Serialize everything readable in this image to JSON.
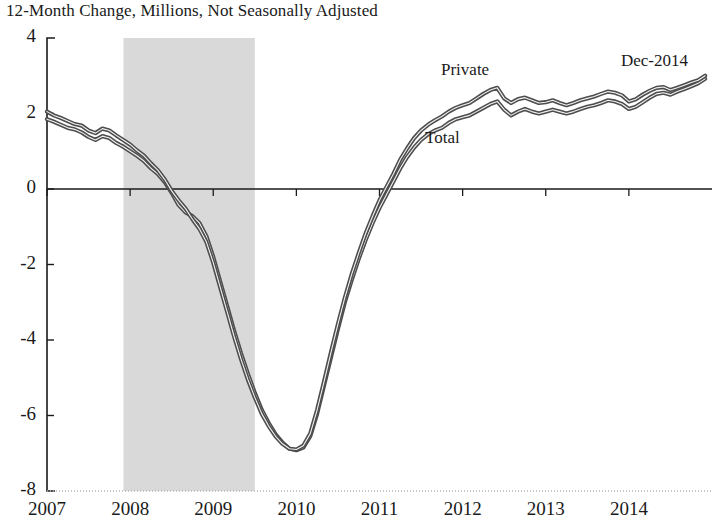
{
  "chart_data": {
    "type": "line",
    "title": "12-Month Change, Millions, Not Seasonally Adjusted",
    "xlabel": "",
    "ylabel": "",
    "ylim": [
      -8,
      4
    ],
    "xlim": [
      2007.0,
      2015.0
    ],
    "yticks": [
      4,
      2,
      0,
      -2,
      -4,
      -6,
      -8
    ],
    "ytick_labels": [
      "4",
      "2",
      "0",
      "-2",
      "-4",
      "-6",
      "-8"
    ],
    "xticks": [
      2007,
      2008,
      2009,
      2010,
      2011,
      2012,
      2013,
      2014
    ],
    "xtick_labels": [
      "2007",
      "2008",
      "2009",
      "2010",
      "2011",
      "2012",
      "2013",
      "2014"
    ],
    "grid": false,
    "legend_position": "inline-annotation",
    "annotations": [
      {
        "text": "Private",
        "x": 2012.0,
        "y": 3.05,
        "name": "private-series-label"
      },
      {
        "text": "Total",
        "x": 2011.6,
        "y": 1.25,
        "name": "total-series-label"
      },
      {
        "text": "Dec-2014",
        "x": 2014.55,
        "y": 3.25,
        "name": "last-observation-label"
      }
    ],
    "shaded_regions": [
      {
        "name": "recession-band",
        "x_start": 2007.92,
        "x_end": 2009.5,
        "color": "#d9d9d9",
        "label": "Recession"
      }
    ],
    "zero_line": {
      "value": 0,
      "color": "#1a1a1a"
    },
    "series": [
      {
        "name": "Total",
        "color": "#4d4d4d",
        "x": [
          2007.0,
          2007.083,
          2007.167,
          2007.25,
          2007.333,
          2007.417,
          2007.5,
          2007.583,
          2007.667,
          2007.75,
          2007.833,
          2007.917,
          2008.0,
          2008.083,
          2008.167,
          2008.25,
          2008.333,
          2008.417,
          2008.5,
          2008.583,
          2008.667,
          2008.75,
          2008.833,
          2008.917,
          2009.0,
          2009.083,
          2009.167,
          2009.25,
          2009.333,
          2009.417,
          2009.5,
          2009.583,
          2009.667,
          2009.75,
          2009.833,
          2009.917,
          2010.0,
          2010.083,
          2010.167,
          2010.25,
          2010.333,
          2010.417,
          2010.5,
          2010.583,
          2010.667,
          2010.75,
          2010.833,
          2010.917,
          2011.0,
          2011.083,
          2011.167,
          2011.25,
          2011.333,
          2011.417,
          2011.5,
          2011.583,
          2011.667,
          2011.75,
          2011.833,
          2011.917,
          2012.0,
          2012.083,
          2012.167,
          2012.25,
          2012.333,
          2012.417,
          2012.5,
          2012.583,
          2012.667,
          2012.75,
          2012.833,
          2012.917,
          2013.0,
          2013.083,
          2013.167,
          2013.25,
          2013.333,
          2013.417,
          2013.5,
          2013.583,
          2013.667,
          2013.75,
          2013.833,
          2013.917,
          2014.0,
          2014.083,
          2014.167,
          2014.25,
          2014.333,
          2014.417,
          2014.5,
          2014.583,
          2014.667,
          2014.75,
          2014.833,
          2014.917
        ],
        "values": [
          1.85,
          1.78,
          1.7,
          1.62,
          1.58,
          1.5,
          1.38,
          1.3,
          1.4,
          1.35,
          1.22,
          1.12,
          1.0,
          0.88,
          0.74,
          0.55,
          0.4,
          0.18,
          -0.1,
          -0.42,
          -0.62,
          -0.72,
          -0.9,
          -1.25,
          -1.8,
          -2.45,
          -3.1,
          -3.75,
          -4.35,
          -4.9,
          -5.4,
          -5.85,
          -6.2,
          -6.5,
          -6.72,
          -6.88,
          -6.92,
          -6.85,
          -6.55,
          -5.95,
          -5.2,
          -4.45,
          -3.7,
          -3.0,
          -2.4,
          -1.85,
          -1.35,
          -0.9,
          -0.5,
          -0.15,
          0.2,
          0.55,
          0.85,
          1.1,
          1.3,
          1.45,
          1.55,
          1.62,
          1.75,
          1.85,
          1.9,
          1.95,
          2.05,
          2.15,
          2.25,
          2.32,
          2.1,
          1.95,
          2.05,
          2.12,
          2.05,
          2.0,
          2.05,
          2.1,
          2.05,
          2.0,
          2.05,
          2.12,
          2.18,
          2.22,
          2.28,
          2.35,
          2.32,
          2.25,
          2.12,
          2.18,
          2.3,
          2.42,
          2.52,
          2.55,
          2.5,
          2.58,
          2.65,
          2.72,
          2.8,
          2.92
        ]
      },
      {
        "name": "Private",
        "color": "#4d4d4d",
        "x": [
          2007.0,
          2007.083,
          2007.167,
          2007.25,
          2007.333,
          2007.417,
          2007.5,
          2007.583,
          2007.667,
          2007.75,
          2007.833,
          2007.917,
          2008.0,
          2008.083,
          2008.167,
          2008.25,
          2008.333,
          2008.417,
          2008.5,
          2008.583,
          2008.667,
          2008.75,
          2008.833,
          2008.917,
          2009.0,
          2009.083,
          2009.167,
          2009.25,
          2009.333,
          2009.417,
          2009.5,
          2009.583,
          2009.667,
          2009.75,
          2009.833,
          2009.917,
          2010.0,
          2010.083,
          2010.167,
          2010.25,
          2010.333,
          2010.417,
          2010.5,
          2010.583,
          2010.667,
          2010.75,
          2010.833,
          2010.917,
          2011.0,
          2011.083,
          2011.167,
          2011.25,
          2011.333,
          2011.417,
          2011.5,
          2011.583,
          2011.667,
          2011.75,
          2011.833,
          2011.917,
          2012.0,
          2012.083,
          2012.167,
          2012.25,
          2012.333,
          2012.417,
          2012.5,
          2012.583,
          2012.667,
          2012.75,
          2012.833,
          2012.917,
          2013.0,
          2013.083,
          2013.167,
          2013.25,
          2013.333,
          2013.417,
          2013.5,
          2013.583,
          2013.667,
          2013.75,
          2013.833,
          2013.917,
          2014.0,
          2014.083,
          2014.167,
          2014.25,
          2014.333,
          2014.417,
          2014.5,
          2014.583,
          2014.667,
          2014.75,
          2014.833,
          2014.917
        ],
        "values": [
          2.05,
          1.95,
          1.88,
          1.8,
          1.72,
          1.68,
          1.55,
          1.48,
          1.6,
          1.55,
          1.42,
          1.3,
          1.18,
          1.02,
          0.88,
          0.68,
          0.5,
          0.25,
          -0.05,
          -0.3,
          -0.52,
          -0.8,
          -1.05,
          -1.4,
          -1.95,
          -2.6,
          -3.25,
          -3.9,
          -4.5,
          -5.05,
          -5.52,
          -5.95,
          -6.28,
          -6.55,
          -6.75,
          -6.88,
          -6.9,
          -6.8,
          -6.48,
          -5.85,
          -5.1,
          -4.32,
          -3.58,
          -2.88,
          -2.25,
          -1.7,
          -1.18,
          -0.72,
          -0.3,
          0.05,
          0.4,
          0.78,
          1.08,
          1.35,
          1.55,
          1.7,
          1.82,
          1.92,
          2.05,
          2.15,
          2.22,
          2.28,
          2.4,
          2.52,
          2.62,
          2.68,
          2.4,
          2.28,
          2.38,
          2.42,
          2.35,
          2.28,
          2.3,
          2.35,
          2.28,
          2.22,
          2.28,
          2.35,
          2.4,
          2.45,
          2.52,
          2.58,
          2.55,
          2.48,
          2.32,
          2.38,
          2.5,
          2.6,
          2.68,
          2.7,
          2.62,
          2.68,
          2.75,
          2.82,
          2.88,
          3.0
        ]
      }
    ]
  },
  "chart": {
    "title": "12-Month Change, Millions, Not Seasonally Adjusted",
    "private_label": "Private",
    "total_label": "Total",
    "dec_annotation": "Dec-2014"
  }
}
